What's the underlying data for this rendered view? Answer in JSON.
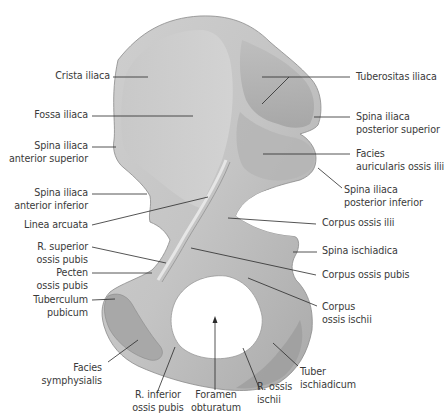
{
  "figure": {
    "colors": {
      "background": "#ffffff",
      "bone_light": "#d6d6d6",
      "bone_mid": "#bdbdbd",
      "bone_dark": "#8e8e8e",
      "leader_line": "#2a2a2a",
      "label_text": "#3a3a3a"
    }
  },
  "labels": {
    "left": [
      {
        "id": "crista-iliaca",
        "lines": [
          "Crista iliaca"
        ]
      },
      {
        "id": "fossa-iliaca",
        "lines": [
          "Fossa iliaca"
        ]
      },
      {
        "id": "spina-iliaca-anterior-superior",
        "lines": [
          "Spina iliaca",
          "anterior superior"
        ]
      },
      {
        "id": "spina-iliaca-anterior-inferior",
        "lines": [
          "Spina iliaca",
          "anterior inferior"
        ]
      },
      {
        "id": "linea-arcuata",
        "lines": [
          "Linea arcuata"
        ]
      },
      {
        "id": "r-superior-ossis-pubis",
        "lines": [
          "R. superior",
          "ossis pubis"
        ]
      },
      {
        "id": "pecten-ossis-pubis",
        "lines": [
          "Pecten",
          "ossis pubis"
        ]
      },
      {
        "id": "tuberculum-pubicum",
        "lines": [
          "Tuberculum",
          "pubicum"
        ]
      }
    ],
    "bottom": [
      {
        "id": "facies-symphysialis",
        "lines": [
          "Facies",
          "symphysialis"
        ]
      },
      {
        "id": "r-inferior-ossis-pubis",
        "lines": [
          "R. inferior",
          "ossis pubis"
        ]
      },
      {
        "id": "foramen-obturatum",
        "lines": [
          "Foramen",
          "obturatum"
        ]
      },
      {
        "id": "r-ossis-ischii",
        "lines": [
          "R. ossis",
          "ischii"
        ]
      },
      {
        "id": "tuber-ischiadicum",
        "lines": [
          "Tuber",
          "ischiadicum"
        ]
      }
    ],
    "right": [
      {
        "id": "tuberositas-iliaca",
        "lines": [
          "Tuberositas iliaca"
        ]
      },
      {
        "id": "spina-iliaca-posterior-superior",
        "lines": [
          "Spina iliaca",
          "posterior superior"
        ]
      },
      {
        "id": "facies-auricularis-ossis-ilii",
        "lines": [
          "Facies",
          "auricularis ossis ilii"
        ]
      },
      {
        "id": "spina-iliaca-posterior-inferior",
        "lines": [
          "Spina iliaca",
          "posterior inferior"
        ]
      },
      {
        "id": "corpus-ossis-ilii",
        "lines": [
          "Corpus ossis ilii"
        ]
      },
      {
        "id": "spina-ischiadica",
        "lines": [
          "Spina ischiadica"
        ]
      },
      {
        "id": "corpus-ossis-pubis",
        "lines": [
          "Corpus ossis pubis"
        ]
      },
      {
        "id": "corpus-ossis-ischii",
        "lines": [
          "Corpus",
          "ossis ischii"
        ]
      }
    ]
  }
}
